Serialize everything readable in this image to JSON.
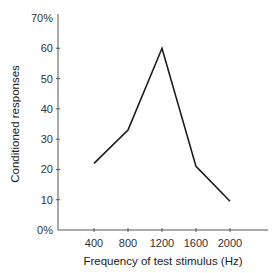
{
  "chart_data": {
    "type": "line",
    "title": "",
    "xlabel": "Frequency of test stimulus (Hz)",
    "ylabel": "Conditioned responses",
    "categories": [
      "400",
      "800",
      "1200",
      "1600",
      "2000"
    ],
    "x": [
      400,
      800,
      1200,
      1600,
      2000
    ],
    "series": [
      {
        "name": "Conditioned responses",
        "values": [
          22,
          33,
          60,
          21,
          9.5
        ]
      }
    ],
    "ylim": [
      0,
      70
    ],
    "yticks": [
      0,
      10,
      20,
      30,
      40,
      50,
      60,
      70
    ],
    "ytick_labels": [
      "0%",
      "10",
      "20",
      "30",
      "40",
      "50",
      "60",
      "70%"
    ],
    "grid": false,
    "legend": null,
    "line_color": "#1a1a1a"
  }
}
